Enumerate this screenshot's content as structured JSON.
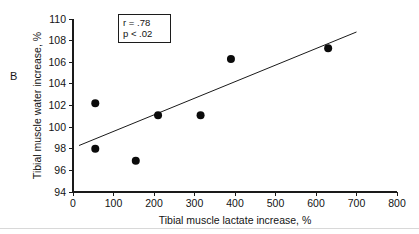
{
  "figure": {
    "panel_label": "B"
  },
  "chart_data": {
    "type": "scatter",
    "title": "",
    "xlabel": "Tibial muscle lactate increase, %",
    "ylabel": "Tibial muscle water increase, %",
    "xlim": [
      0,
      800
    ],
    "ylim": [
      94,
      110
    ],
    "xticks": [
      0,
      100,
      200,
      300,
      400,
      500,
      600,
      700,
      800
    ],
    "yticks": [
      94,
      96,
      98,
      100,
      102,
      104,
      106,
      108,
      110
    ],
    "xtick_labels": [
      "0",
      "100",
      "200",
      "300",
      "400",
      "500",
      "600",
      "700",
      "800"
    ],
    "ytick_labels": [
      "94",
      "96",
      "98",
      "100",
      "102",
      "104",
      "106",
      "108",
      "110"
    ],
    "grid": false,
    "legend": null,
    "points": [
      {
        "x": 55,
        "y": 102.2
      },
      {
        "x": 55,
        "y": 98.0
      },
      {
        "x": 155,
        "y": 96.9
      },
      {
        "x": 210,
        "y": 101.1
      },
      {
        "x": 315,
        "y": 101.1
      },
      {
        "x": 390,
        "y": 106.3
      },
      {
        "x": 630,
        "y": 107.3
      }
    ],
    "trendline": {
      "x_start": 15,
      "y_start": 98.3,
      "x_end": 700,
      "y_end": 108.8
    },
    "annotations": {
      "r_label": "r = .78",
      "p_label": "p < .02"
    }
  },
  "colors": {
    "axis": "#1a1a1a",
    "point": "#0b0b0b",
    "line": "#1a1a1a",
    "text": "#131313",
    "background": "#ffffff"
  }
}
